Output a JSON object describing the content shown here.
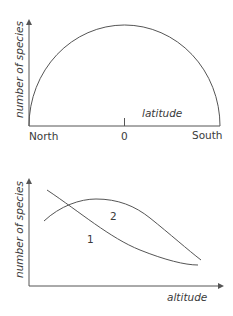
{
  "diagram1": {
    "ylabel": "number of species",
    "xlabel": "latitude",
    "ticks": [
      "North",
      "0",
      "South"
    ],
    "shape": "semicircle — species richness peaks at equator (0) and declines toward North and South"
  },
  "diagram2": {
    "ylabel": "number of species",
    "xlabel": "altitude",
    "curve_labels": [
      "1",
      "2"
    ],
    "description": "Curve 1 decreases monotonically with altitude; curve 2 rises to a mid-altitude peak then declines"
  },
  "colors": {
    "line": "#555555",
    "text": "#3a3a3a",
    "background": "#ffffff"
  }
}
